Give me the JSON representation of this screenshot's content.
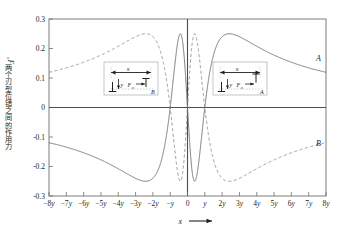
{
  "chart_data": {
    "type": "line",
    "title": "",
    "xlabel": "x",
    "ylabel": "两个刃型位错之间的作用力Fx",
    "xlim": [
      -8,
      8
    ],
    "ylim": [
      -0.3,
      0.3
    ],
    "grid": false,
    "legend_position": "inline-right-edge",
    "xticklabels": [
      "-8y",
      "-7y",
      "-6y",
      "-5y",
      "-4y",
      "-3y",
      "-2y",
      "-y",
      "0",
      "y",
      "2y",
      "3y",
      "4y",
      "5y",
      "6y",
      "7y",
      "8y"
    ],
    "xtickvalues": [
      -8,
      -7,
      -6,
      -5,
      -4,
      -3,
      -2,
      -1,
      0,
      1,
      2,
      3,
      4,
      5,
      6,
      7,
      8
    ],
    "yticklabels": [
      "0.3",
      "0.2",
      "0.1",
      "0",
      "-0.1",
      "-0.2",
      "-0.3"
    ],
    "ytickvalues": [
      0.3,
      0.2,
      0.1,
      0,
      -0.1,
      -0.2,
      -0.3
    ],
    "formula": "Fx = x(x^2 - y^2)/(x^2 + y^2)^2",
    "series": [
      {
        "name": "A",
        "label": "A",
        "style": "solid",
        "color": "#6e6e6e",
        "sign": 1,
        "label_x": 8.0,
        "label_y": 0.145,
        "annotation": "like-sign dislocations",
        "key_points": [
          {
            "x": -8,
            "y": -0.125
          },
          {
            "x": -6,
            "y": -0.166
          },
          {
            "x": -4,
            "y": -0.235
          },
          {
            "x": -2.55,
            "y": -0.25
          },
          {
            "x": -2,
            "y": -0.24
          },
          {
            "x": -1,
            "y": 0.0
          },
          {
            "x": -0.55,
            "y": 0.24
          },
          {
            "x": -0.41,
            "y": 0.25
          },
          {
            "x": 0,
            "y": 0.0
          },
          {
            "x": 0.41,
            "y": -0.25
          },
          {
            "x": 0.55,
            "y": -0.24
          },
          {
            "x": 1,
            "y": 0.0
          },
          {
            "x": 2,
            "y": 0.24
          },
          {
            "x": 2.55,
            "y": 0.25
          },
          {
            "x": 4,
            "y": 0.235
          },
          {
            "x": 6,
            "y": 0.166
          },
          {
            "x": 8,
            "y": 0.125
          }
        ]
      },
      {
        "name": "B",
        "label": "B",
        "style": "dashed",
        "color": "#8f8f8f",
        "sign": -1,
        "label_x": 8.0,
        "label_y": -0.145,
        "annotation": "opposite-sign dislocations",
        "key_points": [
          {
            "x": -8,
            "y": 0.125
          },
          {
            "x": -6,
            "y": 0.166
          },
          {
            "x": -4,
            "y": 0.235
          },
          {
            "x": -2.55,
            "y": 0.25
          },
          {
            "x": -2,
            "y": 0.24
          },
          {
            "x": -1,
            "y": 0.0
          },
          {
            "x": -0.41,
            "y": -0.25
          },
          {
            "x": 0,
            "y": 0.0
          },
          {
            "x": 0.41,
            "y": 0.25
          },
          {
            "x": 1,
            "y": 0.0
          },
          {
            "x": 2,
            "y": -0.24
          },
          {
            "x": 2.55,
            "y": -0.25
          },
          {
            "x": 4,
            "y": -0.235
          },
          {
            "x": 6,
            "y": -0.166
          },
          {
            "x": 8,
            "y": -0.125
          }
        ]
      }
    ]
  },
  "axes": {
    "x_axis_title": "x",
    "x_axis_arrow": "⟶",
    "y_axis_title_cn": "两个刃型位错之间的作用力",
    "y_axis_title_sym": "F",
    "y_axis_title_sub": "x"
  },
  "insets": {
    "left": {
      "name": "inset-diagram-b",
      "dim_label": "x",
      "y_label": "y",
      "force_label": "F",
      "force_sub": "x",
      "curve_label": "B",
      "top_symbol": "⊥",
      "bottom_symbol": "⊥"
    },
    "right": {
      "name": "inset-diagram-a",
      "dim_label": "x",
      "y_label": "y",
      "force_label": "F",
      "force_sub": "x",
      "curve_label": "A",
      "top_symbol": "⊥",
      "bottom_symbol": "⊥"
    }
  },
  "style": {
    "frame_color": "#6e6e6e",
    "solid_curve_color": "#6e6e6e",
    "dashed_curve_color": "#8f8f8f",
    "axis_color": "#4d4d4d",
    "background": "#ffffff",
    "text_color": "#231f20"
  }
}
